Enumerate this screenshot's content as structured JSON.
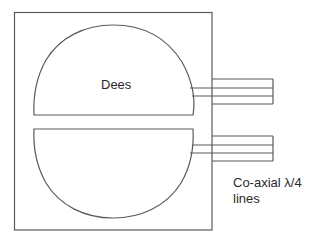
{
  "diagram": {
    "type": "cyclotron-dees-schematic",
    "labels": {
      "dees": "Dees",
      "coax_line1": "Co-axial λ/4",
      "coax_line2": "lines"
    },
    "colors": {
      "stroke": "#5a5a5a",
      "background": "#ffffff",
      "text": "#2b2b2b"
    },
    "components": [
      {
        "name": "enclosure",
        "shape": "rectangle"
      },
      {
        "name": "upper-dee",
        "shape": "half-disc"
      },
      {
        "name": "lower-dee",
        "shape": "half-disc"
      },
      {
        "name": "upper-coaxial-line",
        "shape": "coaxial-stub"
      },
      {
        "name": "lower-coaxial-line",
        "shape": "coaxial-stub"
      }
    ]
  }
}
